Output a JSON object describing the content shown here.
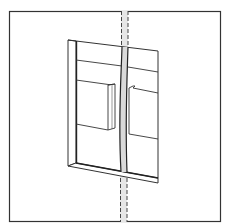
{
  "diagram": {
    "type": "technical-line-drawing",
    "colors": {
      "background": "#ffffff",
      "line": "#333333",
      "pipe_fill": "#d9d9d9",
      "opening_fill": "#ffffff"
    },
    "elements": {
      "frame": "outer-border",
      "opening": "wall-opening",
      "pipe": "vertical-pipe",
      "blocks": [
        "left-block",
        "right-block"
      ]
    },
    "labels": []
  }
}
